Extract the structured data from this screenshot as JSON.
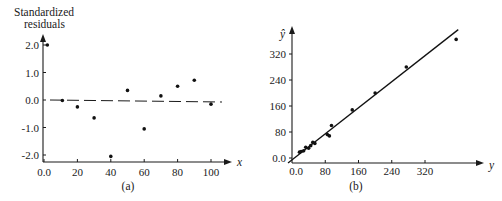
{
  "chart_data": [
    {
      "id": "a",
      "type": "scatter",
      "caption": "(a)",
      "title": "",
      "xlabel": "x",
      "ylabel": "Standardized residuals",
      "ylabel_lines": [
        "Standardized",
        "residuals"
      ],
      "xlim": [
        0,
        105
      ],
      "ylim": [
        -2.2,
        2.4
      ],
      "x_ticks": [
        0,
        20,
        40,
        60,
        80,
        100
      ],
      "x_tick_labels": [
        "0.0",
        "20",
        "40",
        "60",
        "80",
        "100"
      ],
      "y_ticks": [
        2.0,
        1.0,
        0.0,
        -1.0,
        -2.0
      ],
      "y_tick_labels": [
        "2.0",
        "1.0",
        "0.0",
        "-1.0",
        "-2.0"
      ],
      "grid": false,
      "reference_line": {
        "style": "dashed",
        "y": 0.0
      },
      "points": [
        {
          "x": 2,
          "y": 2.0
        },
        {
          "x": 11,
          "y": -0.02
        },
        {
          "x": 20,
          "y": -0.25
        },
        {
          "x": 30,
          "y": -0.65
        },
        {
          "x": 40,
          "y": -2.05
        },
        {
          "x": 50,
          "y": 0.35
        },
        {
          "x": 60,
          "y": -1.05
        },
        {
          "x": 70,
          "y": 0.15
        },
        {
          "x": 80,
          "y": 0.5
        },
        {
          "x": 90,
          "y": 0.72
        },
        {
          "x": 100,
          "y": -0.15
        }
      ]
    },
    {
      "id": "b",
      "type": "scatter",
      "caption": "(b)",
      "title": "",
      "xlabel": "y",
      "ylabel": "ŷ",
      "xlim": [
        0,
        420
      ],
      "ylim": [
        0,
        400
      ],
      "x_ticks": [
        0,
        80,
        160,
        240,
        320
      ],
      "x_tick_labels": [
        "0.0",
        "80",
        "160",
        "240",
        "320"
      ],
      "y_ticks": [
        0,
        80,
        160,
        240,
        320
      ],
      "y_tick_labels": [
        "0.0",
        "80",
        "160",
        "240",
        "320"
      ],
      "grid": false,
      "fit_line": {
        "style": "solid",
        "from": [
          0,
          0
        ],
        "to": [
          400,
          395
        ]
      },
      "points": [
        {
          "x": 18,
          "y": 18
        },
        {
          "x": 22,
          "y": 20
        },
        {
          "x": 28,
          "y": 22
        },
        {
          "x": 33,
          "y": 33
        },
        {
          "x": 40,
          "y": 30
        },
        {
          "x": 45,
          "y": 38
        },
        {
          "x": 50,
          "y": 48
        },
        {
          "x": 55,
          "y": 45
        },
        {
          "x": 85,
          "y": 72
        },
        {
          "x": 90,
          "y": 68
        },
        {
          "x": 95,
          "y": 100
        },
        {
          "x": 145,
          "y": 148
        },
        {
          "x": 200,
          "y": 200
        },
        {
          "x": 275,
          "y": 280
        },
        {
          "x": 395,
          "y": 365
        }
      ]
    }
  ]
}
